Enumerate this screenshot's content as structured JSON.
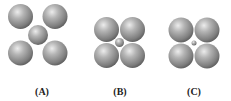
{
  "panels": [
    {
      "label": "(A)",
      "label_pos": {
        "x": 42,
        "y": 86
      },
      "spheres": [
        {
          "role": "corner",
          "cx": 20.5,
          "cy": 16.5,
          "r": 12.5
        },
        {
          "role": "corner",
          "cx": 55,
          "cy": 16.5,
          "r": 12.5
        },
        {
          "role": "corner",
          "cx": 20.5,
          "cy": 53,
          "r": 12.5
        },
        {
          "role": "corner",
          "cx": 55,
          "cy": 53,
          "r": 12.5
        },
        {
          "role": "center",
          "cx": 38,
          "cy": 35,
          "r": 10
        }
      ]
    },
    {
      "label": "(B)",
      "label_pos": {
        "x": 120,
        "y": 86
      },
      "spheres": [
        {
          "role": "corner",
          "cx": 106.5,
          "cy": 29.5,
          "r": 12.5
        },
        {
          "role": "corner",
          "cx": 132.5,
          "cy": 29.5,
          "r": 12.5
        },
        {
          "role": "corner",
          "cx": 106.5,
          "cy": 55.5,
          "r": 12.5
        },
        {
          "role": "corner",
          "cx": 132.5,
          "cy": 55.5,
          "r": 12.5
        },
        {
          "role": "center",
          "cx": 119.5,
          "cy": 42.5,
          "r": 4.5
        }
      ]
    },
    {
      "label": "(C)",
      "label_pos": {
        "x": 194,
        "y": 86
      },
      "spheres": [
        {
          "role": "corner",
          "cx": 181,
          "cy": 30,
          "r": 12.5
        },
        {
          "role": "corner",
          "cx": 207,
          "cy": 30,
          "r": 12.5
        },
        {
          "role": "corner",
          "cx": 181,
          "cy": 56,
          "r": 12.5
        },
        {
          "role": "corner",
          "cx": 207,
          "cy": 56,
          "r": 12.5
        },
        {
          "role": "center",
          "cx": 194,
          "cy": 43,
          "r": 2.5
        }
      ]
    }
  ],
  "colors": {
    "sphere_highlight": "#e6e6e6",
    "sphere_mid": "#a0a0a0",
    "sphere_edge": "#5a5a5a",
    "label": "#222222"
  }
}
